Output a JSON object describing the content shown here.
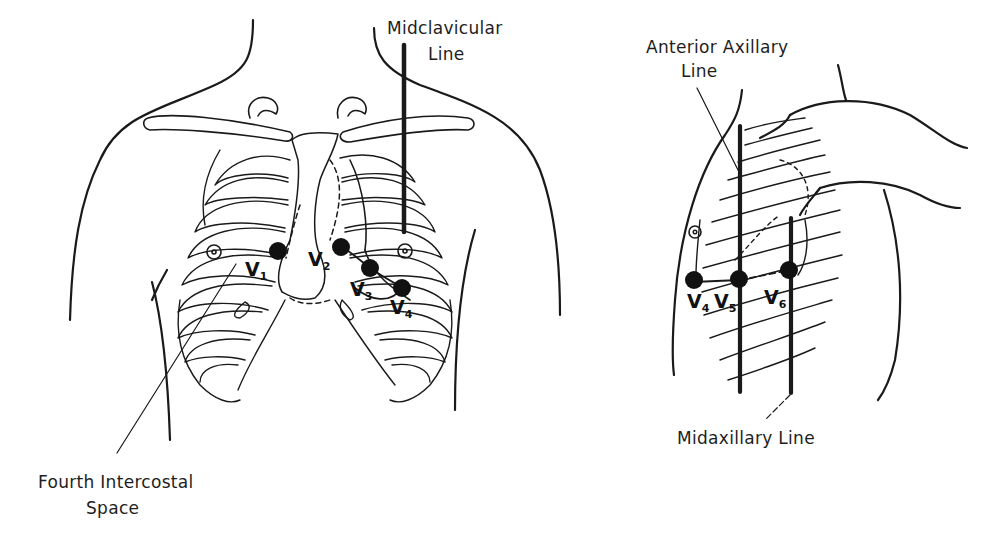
{
  "diagram": {
    "colors": {
      "ink": "#1a1a1a",
      "background": "#ffffff",
      "electrode": "#111111"
    },
    "front_view": {
      "labels": {
        "midclavicular_line_1": "Midclavicular",
        "midclavicular_line_2": "Line",
        "fourth_intercostal_1": "Fourth Intercostal",
        "fourth_intercostal_2": "Space"
      },
      "electrodes": [
        {
          "id": "V1",
          "letter": "V",
          "sub": "1"
        },
        {
          "id": "V2",
          "letter": "V",
          "sub": "2"
        },
        {
          "id": "V3",
          "letter": "V",
          "sub": "3"
        },
        {
          "id": "V4",
          "letter": "V",
          "sub": "4"
        }
      ]
    },
    "side_view": {
      "labels": {
        "anterior_axillary_1": "Anterior Axillary",
        "anterior_axillary_2": "Line",
        "midaxillary": "Midaxillary Line"
      },
      "electrodes": [
        {
          "id": "V4",
          "letter": "V",
          "sub": "4"
        },
        {
          "id": "V5",
          "letter": "V",
          "sub": "5"
        },
        {
          "id": "V6",
          "letter": "V",
          "sub": "6"
        }
      ]
    }
  }
}
